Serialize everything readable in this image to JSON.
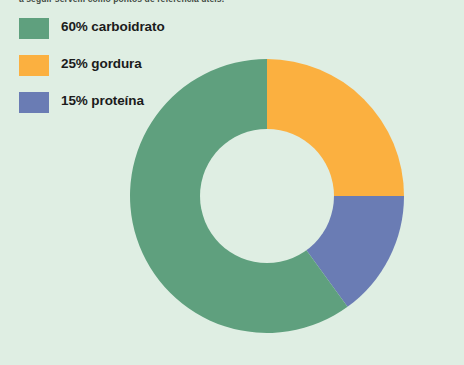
{
  "page": {
    "background_color": "#dfeee3",
    "width": 464,
    "height": 365
  },
  "caption": {
    "text": "a seguir servem como pontos de referência úteis."
  },
  "legend": {
    "items": [
      {
        "label": "60% carboidrato",
        "color": "#5fa07e",
        "swatch_name": "legend-swatch-carboidrato"
      },
      {
        "label": "25% gordura",
        "color": "#fbb040",
        "swatch_name": "legend-swatch-gordura"
      },
      {
        "label": "15% proteína",
        "color": "#6a7cb4",
        "swatch_name": "legend-swatch-proteina"
      }
    ]
  },
  "chart_data": {
    "type": "pie",
    "variant": "donut",
    "title": "",
    "subtitle": "",
    "xlabel": "",
    "ylabel": "",
    "grid": false,
    "legend_position": "top-left",
    "start_angle_deg": 0,
    "direction": "clockwise",
    "center": {
      "x": 267,
      "y": 196
    },
    "outer_radius": 137,
    "inner_radius": 67,
    "hole_color": "#dfeee3",
    "categories": [
      "carboidrato",
      "gordura",
      "proteína"
    ],
    "values": [
      60,
      25,
      15
    ],
    "unit": "%",
    "slices": [
      {
        "name": "gordura",
        "label": "25% gordura",
        "value": 25,
        "color": "#fbb040",
        "start_deg": 0,
        "end_deg": 90
      },
      {
        "name": "proteína",
        "label": "15% proteína",
        "value": 15,
        "color": "#6a7cb4",
        "start_deg": 90,
        "end_deg": 144
      },
      {
        "name": "carboidrato",
        "label": "60% carboidrato",
        "value": 60,
        "color": "#5fa07e",
        "start_deg": 144,
        "end_deg": 360
      }
    ]
  }
}
